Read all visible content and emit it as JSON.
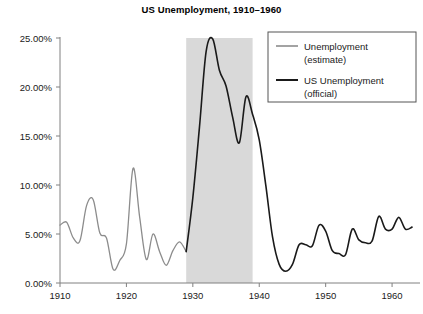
{
  "chart_data": {
    "type": "line",
    "title": "US Unemployment, 1910–1960",
    "xlabel": "",
    "ylabel": "",
    "xlim": [
      1910,
      1963
    ],
    "ylim": [
      0,
      25
    ],
    "grid": false,
    "y_tick_labels": [
      "0.00%",
      "5.00%",
      "10.00%",
      "15.00%",
      "20.00%",
      "25.00%"
    ],
    "y_tick_values": [
      0,
      5,
      10,
      15,
      20,
      25
    ],
    "x_tick_labels": [
      "1910",
      "1920",
      "1930",
      "1940",
      "1950",
      "1960"
    ],
    "x_tick_values": [
      1910,
      1920,
      1930,
      1940,
      1950,
      1960
    ],
    "legend_position": "top-right",
    "shaded_region": {
      "label": "Great Depression",
      "x_start": 1929,
      "x_end": 1939,
      "color": "#d9d9d9"
    },
    "series": [
      {
        "name": "Unemployment (estimate)",
        "color": "#8c8c8c",
        "x": [
          1910,
          1911,
          1912,
          1913,
          1914,
          1915,
          1916,
          1917,
          1918,
          1919,
          1920,
          1921,
          1922,
          1923,
          1924,
          1925,
          1926,
          1927,
          1928,
          1929
        ],
        "values": [
          5.9,
          6.2,
          4.6,
          4.3,
          7.9,
          8.5,
          5.1,
          4.6,
          1.4,
          2.3,
          4.0,
          11.7,
          6.7,
          2.4,
          5.0,
          3.2,
          1.8,
          3.3,
          4.2,
          3.2
        ]
      },
      {
        "name": "US Unemployment (official)",
        "color": "#1a1a1a",
        "x": [
          1929,
          1930,
          1931,
          1932,
          1933,
          1934,
          1935,
          1936,
          1937,
          1938,
          1939,
          1940,
          1941,
          1942,
          1943,
          1944,
          1945,
          1946,
          1947,
          1948,
          1949,
          1950,
          1951,
          1952,
          1953,
          1954,
          1955,
          1956,
          1957,
          1958,
          1959,
          1960,
          1961,
          1962,
          1963
        ],
        "values": [
          3.2,
          8.7,
          15.9,
          23.6,
          24.9,
          21.7,
          20.1,
          16.9,
          14.3,
          19.0,
          17.2,
          14.6,
          9.9,
          4.7,
          1.9,
          1.2,
          1.9,
          3.9,
          3.9,
          3.8,
          5.9,
          5.3,
          3.3,
          3.0,
          2.9,
          5.5,
          4.4,
          4.1,
          4.3,
          6.8,
          5.5,
          5.5,
          6.7,
          5.5,
          5.7
        ]
      }
    ],
    "annotations": []
  },
  "legend": {
    "entries": [
      {
        "label_line1": "Unemployment",
        "label_line2": "(estimate)",
        "color": "#8c8c8c"
      },
      {
        "label_line1": "US Unemployment",
        "label_line2": "(official)",
        "color": "#1a1a1a"
      }
    ]
  }
}
